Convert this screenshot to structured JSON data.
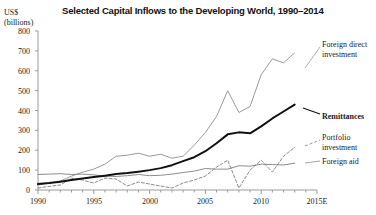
{
  "chart_data": {
    "type": "line",
    "title": "Selected Capital Inflows to the Developing World, 1990–2014",
    "xlabel": "",
    "ylabel": "US$ (billions)",
    "ylabel_line1": "US$",
    "ylabel_line2": "(billions)",
    "ylim": [
      0,
      800
    ],
    "ytick_values": [
      0,
      100,
      200,
      300,
      400,
      500,
      600,
      700,
      800
    ],
    "ytick_labels": [
      "0",
      "100",
      "200",
      "300",
      "400",
      "500",
      "600",
      "700",
      "800"
    ],
    "xlim": [
      1990,
      2015
    ],
    "xtick_values": [
      1990,
      1995,
      2000,
      2005,
      2010,
      2015
    ],
    "xtick_labels": [
      "1990",
      "1995",
      "2000",
      "2005",
      "2010",
      "2015E"
    ],
    "minor_xticks": true,
    "grid": false,
    "legend_position": "right-inline-labels",
    "x": [
      1990,
      1991,
      1992,
      1993,
      1994,
      1995,
      1996,
      1997,
      1998,
      1999,
      2000,
      2001,
      2002,
      2003,
      2004,
      2005,
      2006,
      2007,
      2008,
      2009,
      2010,
      2011,
      2012,
      2013
    ],
    "series": [
      {
        "name": "Foreign direct investment",
        "style": "solid-thin-gray",
        "color": "#9a9a9a",
        "values": [
          25,
          35,
          45,
          70,
          90,
          105,
          130,
          170,
          175,
          185,
          170,
          180,
          160,
          170,
          225,
          290,
          370,
          500,
          390,
          420,
          580,
          660,
          640,
          690
        ]
      },
      {
        "name": "Remittances",
        "style": "solid-thick-black",
        "color": "#111111",
        "values": [
          30,
          35,
          42,
          50,
          58,
          65,
          72,
          80,
          85,
          92,
          100,
          110,
          125,
          145,
          165,
          195,
          235,
          280,
          290,
          285,
          320,
          360,
          395,
          430
        ]
      },
      {
        "name": "Portfolio investment",
        "style": "dashed-gray",
        "color": "#7d7d7d",
        "values": [
          10,
          18,
          25,
          60,
          50,
          35,
          60,
          55,
          20,
          40,
          30,
          20,
          10,
          35,
          50,
          70,
          115,
          150,
          10,
          100,
          150,
          90,
          170,
          215
        ]
      },
      {
        "name": "Foreign aid",
        "style": "solid-thin-gray-flat",
        "color": "#8c8c8c",
        "values": [
          78,
          80,
          82,
          78,
          80,
          76,
          70,
          68,
          72,
          78,
          72,
          74,
          80,
          88,
          95,
          108,
          105,
          105,
          122,
          120,
          130,
          128,
          126,
          135
        ]
      }
    ],
    "annotations": [
      {
        "label": "Foreign direct investment",
        "for_series": "Foreign direct investment",
        "emphasis": "normal"
      },
      {
        "label": "Remittances",
        "for_series": "Remittances",
        "emphasis": "bold"
      },
      {
        "label": "Portfolio investment",
        "for_series": "Portfolio investment",
        "emphasis": "normal"
      },
      {
        "label": "Foreign aid",
        "for_series": "Foreign aid",
        "emphasis": "normal"
      }
    ]
  },
  "labels": {
    "fdi_line1": "Foreign direct",
    "fdi_line2": "investment",
    "remittances": "Remittances",
    "portfolio_line1": "Portfolio",
    "portfolio_line2": "investment",
    "foreign_aid": "Foreign aid"
  },
  "colors": {
    "axis": "#9b9b9b",
    "fdi": "#9a9a9a",
    "remittances": "#111111",
    "portfolio": "#7d7d7d",
    "foreign_aid": "#8c8c8c",
    "text": "#1a1a1a",
    "background": "#ffffff"
  }
}
